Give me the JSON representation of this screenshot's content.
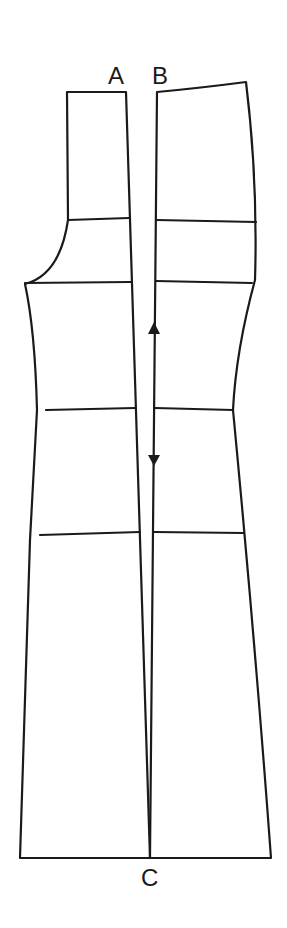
{
  "diagram": {
    "type": "sewing-pattern",
    "labels": {
      "a": "A",
      "b": "B",
      "c": "C"
    },
    "colors": {
      "line": "#1a1a1a",
      "background": "#ffffff"
    },
    "grainline": {
      "direction": "double-headed vertical",
      "icon": "grainline-arrow-icon"
    },
    "panels": [
      {
        "name": "left-panel",
        "horizontal_lines": 4
      },
      {
        "name": "right-panel",
        "horizontal_lines": 4
      }
    ]
  }
}
